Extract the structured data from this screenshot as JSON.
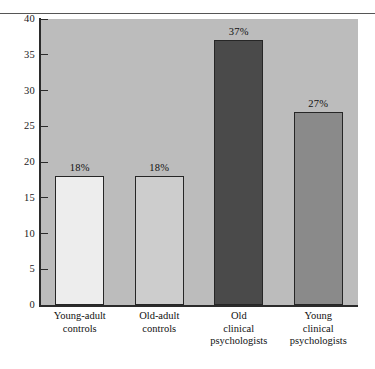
{
  "figure": {
    "kind": "bar-chart-figure",
    "background_color": "#ffffff",
    "plot_background_color": "#bcbcbc",
    "axis_color": "#2b2b2b",
    "rule_color": "#565656"
  },
  "chart_data": {
    "type": "bar",
    "title": "",
    "subtitle": "",
    "xlabel": "",
    "ylabel": "",
    "categories": [
      "Young-adult controls",
      "Old-adult controls",
      "Old clinical psychologists",
      "Young clinical psychologists"
    ],
    "category_lines": [
      [
        "Young-adult",
        "controls"
      ],
      [
        "Old-adult",
        "controls"
      ],
      [
        "Old",
        "clinical",
        "psychologists"
      ],
      [
        "Young",
        "clinical",
        "psychologists"
      ]
    ],
    "values": [
      18,
      18,
      37,
      27
    ],
    "data_labels": [
      "18%",
      "18%",
      "37%",
      "27%"
    ],
    "bar_colors": [
      "#ededed",
      "#cdcdcd",
      "#4a4a4a",
      "#8a8a8a"
    ],
    "bar_edge_color": "#262626",
    "ylim": [
      0,
      40
    ],
    "yticks": [
      0,
      5,
      10,
      15,
      20,
      25,
      30,
      35,
      40
    ],
    "ytick_labels": [
      "0",
      "5",
      "10",
      "15",
      "20",
      "25",
      "30",
      "35",
      "40"
    ],
    "grid": false,
    "legend": null,
    "legend_position": "none",
    "annotations": []
  }
}
